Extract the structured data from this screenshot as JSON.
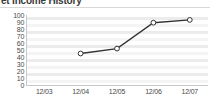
{
  "widget": {
    "title": "et Income History",
    "title_full": "Net Income History"
  },
  "chart_data": {
    "type": "line",
    "title": "et Income History",
    "xlabel": "",
    "ylabel": "",
    "categories": [
      "12/03",
      "12/04",
      "12/05",
      "12/06",
      "12/07"
    ],
    "x": [
      "12/03",
      "12/04",
      "12/05",
      "12/06",
      "12/07"
    ],
    "values": [
      null,
      45,
      52,
      89,
      93
    ],
    "series": [
      {
        "name": "Net Income",
        "values": [
          null,
          45,
          52,
          89,
          93
        ],
        "line_color": "#333333",
        "marker_color": "#ffffff",
        "marker_edge_color": "#333333"
      }
    ],
    "ylim": [
      0,
      100
    ],
    "yticks": [
      100,
      90,
      80,
      70,
      60,
      50,
      40,
      30,
      20,
      10,
      0
    ],
    "ytick_labels": [
      "100",
      "90",
      "80",
      "70",
      "60",
      "50",
      "40",
      "30",
      "20",
      "10",
      "0"
    ],
    "xtick_labels": [
      "12/03",
      "12/04",
      "12/05",
      "12/06",
      "12/07"
    ],
    "grid": "horizontal-bands",
    "band_color": "#ececec",
    "legend": null,
    "legend_position": "none"
  },
  "colors": {
    "background": "#ffffff",
    "band": "#ececec",
    "axis": "#c9c9c9",
    "text": "#4a4a4a",
    "title": "#3a3a3a",
    "line": "#333333"
  }
}
